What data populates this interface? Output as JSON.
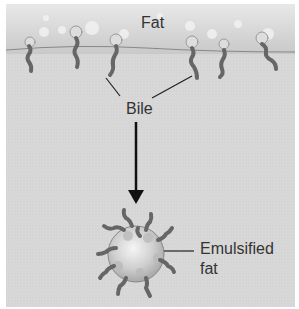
{
  "diagram": {
    "title_labels": {
      "fat": "Fat",
      "bile": "Bile",
      "emulsified_line1": "Emulsified",
      "emulsified_line2": "fat"
    },
    "colors": {
      "background": "#d6d6d6",
      "fat_layer": "#c9c9c9",
      "bile_molecule": "#777777",
      "arrow": "#111111",
      "text": "#333333"
    },
    "elements": [
      {
        "type": "region",
        "label": "Fat"
      },
      {
        "type": "molecules",
        "name": "bile salts",
        "count": 7
      },
      {
        "type": "arrow",
        "from": "Bile",
        "to": "Emulsified fat"
      },
      {
        "type": "droplet",
        "label": "Emulsified fat",
        "attached_bile_count": 10
      }
    ]
  }
}
